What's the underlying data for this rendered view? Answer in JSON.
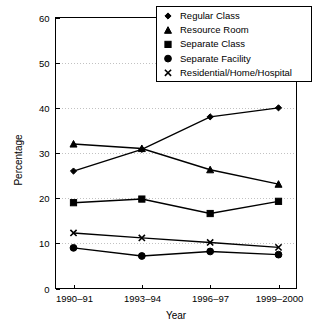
{
  "chart_data": {
    "type": "line",
    "title": "",
    "xlabel": "Year",
    "ylabel": "Percentage",
    "categories": [
      "1990–91",
      "1993–94",
      "1996–97",
      "1999–2000"
    ],
    "ylim": [
      0,
      60
    ],
    "yticks": [
      0,
      10,
      20,
      30,
      40,
      50,
      60
    ],
    "ytick_labels": [
      "0",
      "10",
      "20",
      "30",
      "40",
      "50",
      "60"
    ],
    "grid": true,
    "legend_position": "top-right",
    "series": [
      {
        "name": "Regular Class",
        "marker": "diamond",
        "values": [
          26.0,
          30.8,
          38.0,
          40.0
        ]
      },
      {
        "name": "Resource Room",
        "marker": "triangle",
        "values": [
          32.0,
          31.0,
          26.3,
          23.1
        ]
      },
      {
        "name": "Separate Class",
        "marker": "square",
        "values": [
          19.0,
          19.8,
          16.6,
          19.3
        ]
      },
      {
        "name": "Separate Facility",
        "marker": "circle",
        "values": [
          9.0,
          7.2,
          8.2,
          7.5
        ]
      },
      {
        "name": "Residential/Home/Hospital",
        "marker": "x",
        "values": [
          12.3,
          11.2,
          10.2,
          9.1
        ]
      }
    ]
  },
  "legend": {
    "items": [
      {
        "label": "Regular Class",
        "marker": "diamond"
      },
      {
        "label": "Resource Room",
        "marker": "triangle"
      },
      {
        "label": "Separate Class",
        "marker": "square"
      },
      {
        "label": "Separate Facility",
        "marker": "circle"
      },
      {
        "label": "Residential/Home/Hospital",
        "marker": "x"
      }
    ]
  },
  "colors": {
    "ink": "#000000",
    "grid": "#9a9a9a",
    "background": "#ffffff"
  }
}
